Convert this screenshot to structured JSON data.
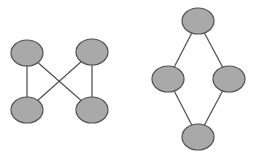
{
  "colors": {
    "node_fill": "#a9a9a9",
    "node_stroke": "#505050",
    "edge": "#555555",
    "background": "#ffffff"
  },
  "graphs": [
    {
      "name": "crossed-square-graph",
      "nodes": [
        {
          "id": "a",
          "cx": 27,
          "cy": 53
        },
        {
          "id": "b",
          "cx": 92,
          "cy": 52
        },
        {
          "id": "c",
          "cx": 27,
          "cy": 110
        },
        {
          "id": "d",
          "cx": 92,
          "cy": 110
        }
      ],
      "edges": [
        [
          "a",
          "c"
        ],
        [
          "b",
          "d"
        ],
        [
          "a",
          "d"
        ],
        [
          "b",
          "c"
        ]
      ]
    },
    {
      "name": "diamond-graph",
      "nodes": [
        {
          "id": "a",
          "cx": 198,
          "cy": 21
        },
        {
          "id": "b",
          "cx": 168,
          "cy": 79
        },
        {
          "id": "c",
          "cx": 229,
          "cy": 79
        },
        {
          "id": "d",
          "cx": 198,
          "cy": 137
        }
      ],
      "edges": [
        [
          "a",
          "b"
        ],
        [
          "a",
          "c"
        ],
        [
          "b",
          "d"
        ],
        [
          "c",
          "d"
        ]
      ]
    }
  ],
  "node_rx": 16,
  "node_ry": 13
}
